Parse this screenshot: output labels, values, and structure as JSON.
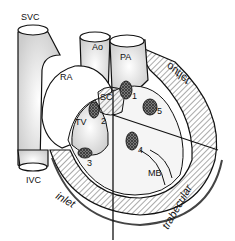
{
  "labels": {
    "svc": "SVC",
    "ivc": "IVC",
    "ao": "Ao",
    "pa": "PA",
    "ra": "RA",
    "sc": "SC",
    "tv": "TV",
    "mb": "MB",
    "n1": "1",
    "n2": "2",
    "n3": "3",
    "n4": "4",
    "n5": "5",
    "inlet": "inlet",
    "outlet": "outlet",
    "trabecular": "trabecular"
  }
}
